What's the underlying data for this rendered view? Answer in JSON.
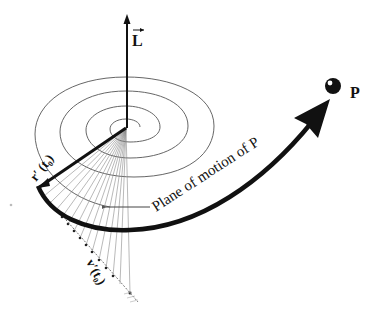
{
  "figure": {
    "labels": {
      "angular_momentum": "L",
      "position_vector": "r′ (t₀)",
      "velocity_vector": "v′(t₀)",
      "plane": "Plane of motion of P",
      "particle": "P"
    },
    "colors": {
      "ink": "#111111",
      "spiral": "#555555",
      "hatch": "#8a8a8a",
      "background": "#ffffff"
    },
    "elements": [
      "angular-momentum-vector",
      "spiral-path",
      "position-vector",
      "swept-area-hatching",
      "velocity-tangent-line",
      "trajectory-arrow",
      "particle-dot"
    ]
  }
}
